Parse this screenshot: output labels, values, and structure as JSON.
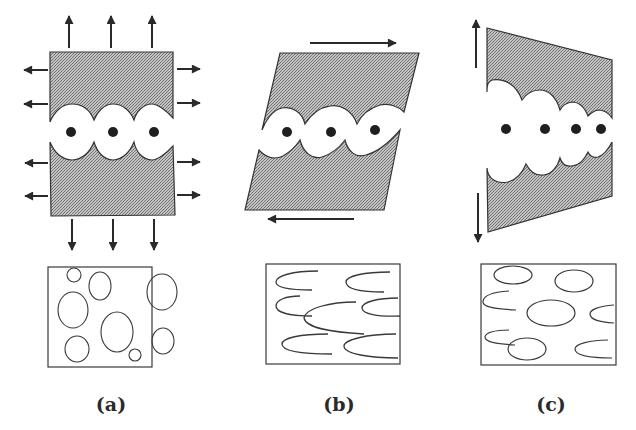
{
  "figure": {
    "fill_color": "#a9a9a9",
    "stroke_color": "#333333",
    "panels": [
      {
        "id": "a",
        "label": "(a)",
        "loading": "equibiaxial tension",
        "top_arrows": 3,
        "bottom_arrows": 3,
        "left_arrows": 4,
        "right_arrows": 4,
        "void_count": 3,
        "void_shape": "circular",
        "micro_shapes": "circles",
        "micro_count": 9
      },
      {
        "id": "b",
        "label": "(b)",
        "loading": "simple shear",
        "top_arrow_direction": "right",
        "bottom_arrow_direction": "left",
        "void_count": 3,
        "void_shape": "sheared ellipses",
        "micro_shapes": "open crescents",
        "micro_count": 8
      },
      {
        "id": "c",
        "label": "(c)",
        "loading": "bending / opening",
        "left_top_arrow": "up",
        "left_bottom_arrow": "down",
        "void_count": 4,
        "void_shape": "decreasing-size lobes",
        "micro_shapes": "ellipses and crescents",
        "micro_count": 9
      }
    ]
  }
}
